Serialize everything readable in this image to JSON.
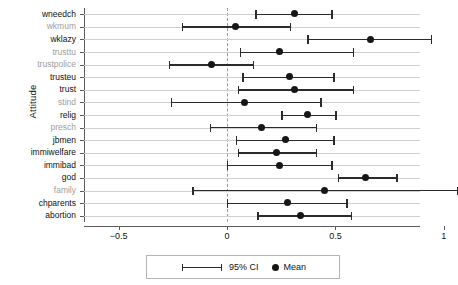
{
  "chart_data": {
    "type": "scatter",
    "title": "",
    "xlabel": "",
    "ylabel": "Attitude",
    "xlim": [
      -0.66,
      0.89
    ],
    "xticks": [
      -0.5,
      0,
      0.5,
      1
    ],
    "xticklabels": [
      "−0.5",
      "0",
      "0.5",
      "1"
    ],
    "grid": true,
    "zero_reference_line": 0,
    "legend_position": "bottom",
    "categories": [
      "wneedch",
      "wkmum",
      "wklazy",
      "trusttu",
      "trustpolice",
      "trusteu",
      "trust",
      "stind",
      "relig",
      "presch",
      "jbmen",
      "immiwelfare",
      "immibad",
      "god",
      "family",
      "chparents",
      "abortion"
    ],
    "points": [
      {
        "label": "wneedch",
        "mean": 0.31,
        "ci_low": 0.13,
        "ci_high": 0.48,
        "label_dim": false
      },
      {
        "label": "wkmum",
        "mean": 0.04,
        "ci_low": -0.21,
        "ci_high": 0.29,
        "label_dim": true
      },
      {
        "label": "wklazy",
        "mean": 0.66,
        "ci_low": 0.37,
        "ci_high": 0.94,
        "label_dim": false
      },
      {
        "label": "trusttu",
        "mean": 0.24,
        "ci_low": 0.06,
        "ci_high": 0.58,
        "label_dim": true
      },
      {
        "label": "trustpolice",
        "mean": -0.07,
        "ci_low": -0.27,
        "ci_high": 0.12,
        "label_dim": true
      },
      {
        "label": "trusteu",
        "mean": 0.29,
        "ci_low": 0.07,
        "ci_high": 0.49,
        "label_dim": false
      },
      {
        "label": "trust",
        "mean": 0.31,
        "ci_low": 0.05,
        "ci_high": 0.58,
        "label_dim": false
      },
      {
        "label": "stind",
        "mean": 0.08,
        "ci_low": -0.26,
        "ci_high": 0.43,
        "label_dim": true
      },
      {
        "label": "relig",
        "mean": 0.37,
        "ci_low": 0.25,
        "ci_high": 0.5,
        "label_dim": false
      },
      {
        "label": "presch",
        "mean": 0.16,
        "ci_low": -0.08,
        "ci_high": 0.41,
        "label_dim": true
      },
      {
        "label": "jbmen",
        "mean": 0.27,
        "ci_low": 0.04,
        "ci_high": 0.49,
        "label_dim": false
      },
      {
        "label": "immiwelfare",
        "mean": 0.23,
        "ci_low": 0.05,
        "ci_high": 0.41,
        "label_dim": false
      },
      {
        "label": "immibad",
        "mean": 0.24,
        "ci_low": 0.0,
        "ci_high": 0.48,
        "label_dim": false
      },
      {
        "label": "god",
        "mean": 0.64,
        "ci_low": 0.51,
        "ci_high": 0.78,
        "label_dim": false
      },
      {
        "label": "family",
        "mean": 0.45,
        "ci_low": -0.16,
        "ci_high": 1.06,
        "label_dim": true
      },
      {
        "label": "chparents",
        "mean": 0.28,
        "ci_low": 0.0,
        "ci_high": 0.55,
        "label_dim": false
      },
      {
        "label": "abortion",
        "mean": 0.34,
        "ci_low": 0.14,
        "ci_high": 0.57,
        "label_dim": false
      }
    ],
    "legend": [
      {
        "key": "ci",
        "label": "95% CI"
      },
      {
        "key": "mean",
        "label": "Mean"
      }
    ]
  },
  "colors": {
    "marker": "#161616",
    "bar": "#2b2b2b",
    "grid": "#cfcfcf",
    "axis": "#5a5a5a",
    "zero_line": "#9a9a9a",
    "label": "#111111",
    "label_dim": "#9e9e9e"
  }
}
